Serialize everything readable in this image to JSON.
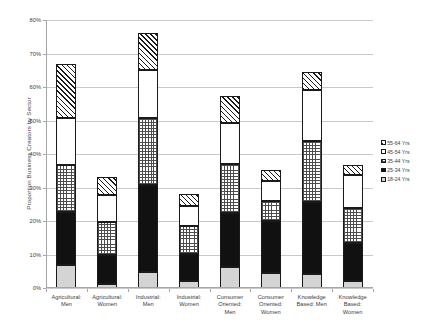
{
  "chart_data": {
    "type": "bar",
    "subtype": "stacked-column",
    "title": "",
    "xlabel": "",
    "ylabel": "Proportion Business Creators by Sector",
    "ylim": [
      0,
      80
    ],
    "ytick_labels": [
      "0%",
      "10%",
      "20%",
      "30%",
      "40%",
      "50%",
      "60%",
      "70%",
      "80%"
    ],
    "ytick_values": [
      0,
      10,
      20,
      30,
      40,
      50,
      60,
      70,
      80
    ],
    "grid": true,
    "legend_position": "right",
    "categories": [
      "Agricultural: Men",
      "Agricultural: Women",
      "Industrial: Men",
      "Industrial: Women",
      "Consumer Oriented: Men",
      "Consumer Oriented: Women",
      "Knowledge Based: Men",
      "Knowledge Based: Women"
    ],
    "category_lines": [
      [
        "Agricultural:",
        "Men"
      ],
      [
        "Agricultural:",
        "Women"
      ],
      [
        "Industrial:",
        "Men"
      ],
      [
        "Industrial:",
        "Women"
      ],
      [
        "Consumer",
        "Oriented:",
        "Men"
      ],
      [
        "Consumer",
        "Oriented:",
        "Women"
      ],
      [
        "Knowledge",
        "Based: Men"
      ],
      [
        "Knowledge",
        "Based:",
        "Women"
      ]
    ],
    "series": [
      {
        "name": "18-24 Yrs",
        "key": "f-1824",
        "values": [
          6.9,
          1.2,
          4.8,
          2.1,
          6.3,
          4.5,
          4.2,
          2.1
        ]
      },
      {
        "name": "25-34 Yrs",
        "key": "f-2534",
        "values": [
          15.8,
          8.7,
          26.0,
          8.1,
          16.1,
          15.5,
          21.5,
          11.3
        ]
      },
      {
        "name": "35-44 Yrs",
        "key": "f-3544",
        "values": [
          14.0,
          9.9,
          20.0,
          8.4,
          14.6,
          6.0,
          18.2,
          10.5
        ]
      },
      {
        "name": "45-54 Yrs",
        "key": "f-4554",
        "values": [
          14.2,
          8.1,
          14.3,
          6.0,
          12.2,
          6.0,
          15.2,
          9.9
        ]
      },
      {
        "name": "55-64 Yrs",
        "key": "f-5564",
        "values": [
          16.0,
          5.1,
          11.1,
          3.6,
          8.0,
          3.2,
          5.3,
          2.9
        ]
      }
    ],
    "legend_entries": [
      {
        "label": "55-64 Yrs",
        "key": "f-5564"
      },
      {
        "label": "45-54 Yrs",
        "key": "f-4554"
      },
      {
        "label": "35-44 Yrs",
        "key": "f-3544"
      },
      {
        "label": "25-34 Yrs",
        "key": "f-2534"
      },
      {
        "label": "18-24 Yrs",
        "key": "f-1824"
      }
    ],
    "totals": [
      66.9,
      33.0,
      76.2,
      28.2,
      57.2,
      35.2,
      64.4,
      36.7
    ],
    "colors": {
      "grid": "#c9c9c9",
      "axis": "#a6a6a6",
      "text": "#3d3d3d",
      "f-1824": "#d4d4d4",
      "f-2534": "#111111",
      "f-3544": "#ffffff",
      "f-4554": "#ffffff",
      "f-5564": "#ffffff"
    }
  }
}
